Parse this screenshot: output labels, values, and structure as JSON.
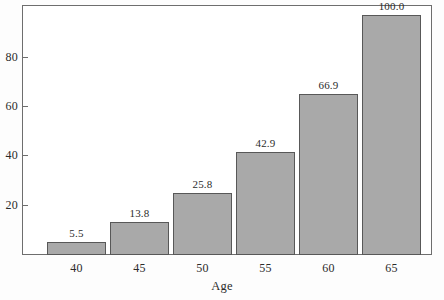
{
  "chart_data": {
    "type": "bar",
    "title": "",
    "subtitle": "",
    "xlabel": "Age",
    "ylabel": "",
    "categories": [
      "40",
      "45",
      "50",
      "55",
      "60",
      "65"
    ],
    "values": [
      5.5,
      13.8,
      25.8,
      42.9,
      66.9,
      100.0
    ],
    "data_labels": [
      "5.5",
      "13.8",
      "25.8",
      "42.9",
      "66.9",
      "100.0"
    ],
    "series": [
      {
        "name": "",
        "values": [
          5.5,
          13.8,
          25.8,
          42.9,
          66.9,
          100.0
        ]
      }
    ],
    "xtick_labels": [
      "40",
      "45",
      "50",
      "55",
      "60",
      "65"
    ],
    "ytick_labels": [
      "20",
      "40",
      "60",
      "80"
    ],
    "ytick_values": [
      20,
      40,
      60,
      80
    ],
    "ylim": [
      0,
      104
    ],
    "xlim_note": "categorical, 6 equal-width bars",
    "grid": false,
    "legend": false,
    "legend_position": "none",
    "bar_fill_color": "#a9a9a9",
    "bar_edge_color": "#585858",
    "frame_color": "#6e6e6e",
    "text_color": "#2b2b2b",
    "background_color": "#ffffff"
  }
}
